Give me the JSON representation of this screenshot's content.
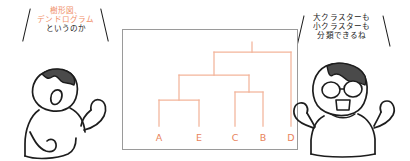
{
  "scene": {
    "width": 410,
    "height": 161,
    "background": "#ffffff",
    "description": "Hand-drawn illustration: two characters commenting on a dendrogram diagram"
  },
  "colors": {
    "accent_orange": "#f0906a",
    "dendrogram_line": "#f3b49a",
    "leaf_label": "#e8835c",
    "text_black": "#1a1a1a",
    "panel_border": "#9a9a9a",
    "hair_fill": "#4a4a4a",
    "outline": "#1d1d1d"
  },
  "speech_left": {
    "name": "left-character-speech",
    "lines": [
      {
        "text": "樹形図、",
        "style": "accent"
      },
      {
        "text": "デンドログラム",
        "style": "accent"
      },
      {
        "text": "というのか",
        "style": "plain"
      }
    ]
  },
  "speech_right": {
    "name": "right-character-speech",
    "lines": [
      {
        "text": "大クラスターも",
        "style": "plain"
      },
      {
        "text": "小クラスターも",
        "style": "plain"
      },
      {
        "text": "分類できるね",
        "style": "plain"
      }
    ]
  },
  "characters": {
    "left": {
      "name": "left-character",
      "pose": "back-side view, one arm raised, dark hair on top"
    },
    "right": {
      "name": "right-character",
      "pose": "front view with glasses, open mouth, both arms raised"
    }
  },
  "chart_data": {
    "type": "dendrogram",
    "title": "",
    "xlabel": "",
    "ylabel": "",
    "grid": false,
    "legend": null,
    "leaves": [
      "A",
      "E",
      "C",
      "B",
      "D"
    ],
    "leaf_x": [
      36,
      76,
      112,
      140,
      168
    ],
    "leaf_positions_note": "x coordinates in panel pixel space, baseline at y=96",
    "baseline_y": 96,
    "merges": [
      {
        "id": "n1",
        "children": [
          "A",
          "E"
        ],
        "height": 70,
        "x": 56
      },
      {
        "id": "n2",
        "children": [
          "C",
          "B"
        ],
        "height": 62,
        "x": 126
      },
      {
        "id": "n3",
        "children": [
          "n1",
          "n2"
        ],
        "height": 45,
        "x": 91
      },
      {
        "id": "n4",
        "children": [
          "n3",
          "D"
        ],
        "height": 22,
        "x": 129
      }
    ],
    "root": "n4",
    "root_stem_top": 12,
    "height_axis_note": "smaller y pixel value = greater merge height (inverted screen coords)"
  },
  "diagram_panel": {
    "name": "dendrogram-panel",
    "border_color": "#9a9a9a"
  }
}
